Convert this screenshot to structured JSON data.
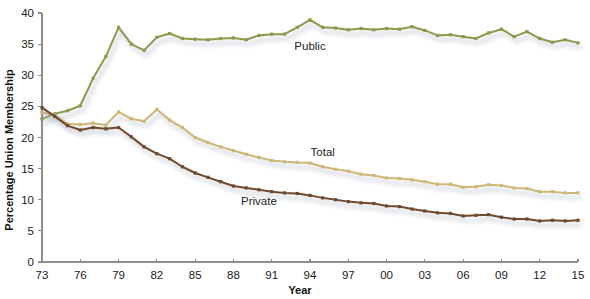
{
  "chart_data": {
    "type": "line",
    "title": "",
    "xlabel": "Year",
    "ylabel": "Percentage Union Membership",
    "xlim": [
      1973,
      2015
    ],
    "ylim": [
      0,
      40
    ],
    "grid": false,
    "legend_position": "inline-labels",
    "y_ticks": [
      "0",
      "5",
      "10",
      "15",
      "20",
      "25",
      "30",
      "35",
      "40"
    ],
    "y_tick_values": [
      0,
      5,
      10,
      15,
      20,
      25,
      30,
      35,
      40
    ],
    "x_ticks": [
      "73",
      "76",
      "79",
      "82",
      "85",
      "88",
      "91",
      "94",
      "97",
      "00",
      "03",
      "06",
      "09",
      "12",
      "15"
    ],
    "x_tick_values": [
      1973,
      1976,
      1979,
      1982,
      1985,
      1988,
      1991,
      1994,
      1997,
      2000,
      2003,
      2006,
      2009,
      2012,
      2015
    ],
    "x": [
      1973,
      1974,
      1975,
      1976,
      1977,
      1978,
      1979,
      1980,
      1981,
      1982,
      1983,
      1984,
      1985,
      1986,
      1987,
      1988,
      1989,
      1990,
      1991,
      1992,
      1993,
      1994,
      1995,
      1996,
      1997,
      1998,
      1999,
      2000,
      2001,
      2002,
      2003,
      2004,
      2005,
      2006,
      2007,
      2008,
      2009,
      2010,
      2011,
      2012,
      2013,
      2014,
      2015
    ],
    "series": [
      {
        "name": "Public",
        "color": "#8c9a4d",
        "label": "Public",
        "label_x": 1994,
        "label_y": 34.0,
        "values": [
          23.0,
          23.8,
          24.3,
          25.1,
          29.5,
          33.0,
          37.7,
          35.0,
          34.0,
          36.1,
          36.7,
          35.9,
          35.8,
          35.7,
          35.9,
          36.0,
          35.7,
          36.4,
          36.6,
          36.6,
          37.7,
          38.9,
          37.7,
          37.6,
          37.3,
          37.5,
          37.3,
          37.5,
          37.4,
          37.8,
          37.2,
          36.4,
          36.5,
          36.2,
          35.9,
          36.8,
          37.4,
          36.2,
          37.0,
          35.9,
          35.3,
          35.7,
          35.2
        ]
      },
      {
        "name": "Total",
        "color": "#cdb877",
        "label": "Total",
        "label_x": 1995,
        "label_y": 17.0,
        "values": [
          24.0,
          23.6,
          22.2,
          22.1,
          22.3,
          22.0,
          24.1,
          23.0,
          22.6,
          24.5,
          22.8,
          21.6,
          20.0,
          19.2,
          18.5,
          17.9,
          17.3,
          16.8,
          16.3,
          16.1,
          16.0,
          15.9,
          15.3,
          14.9,
          14.6,
          14.1,
          13.9,
          13.5,
          13.4,
          13.2,
          12.9,
          12.5,
          12.5,
          12.0,
          12.1,
          12.4,
          12.3,
          11.9,
          11.8,
          11.3,
          11.3,
          11.1,
          11.1
        ]
      },
      {
        "name": "Private",
        "color": "#70492f",
        "label": "Private",
        "label_x": 1990,
        "label_y": 9.2,
        "values": [
          24.8,
          23.4,
          21.9,
          21.2,
          21.6,
          21.4,
          21.6,
          20.1,
          18.5,
          17.4,
          16.6,
          15.3,
          14.3,
          13.6,
          12.9,
          12.2,
          11.9,
          11.6,
          11.3,
          11.1,
          11.0,
          10.7,
          10.3,
          10.0,
          9.7,
          9.5,
          9.4,
          9.0,
          8.9,
          8.5,
          8.2,
          7.9,
          7.8,
          7.4,
          7.5,
          7.6,
          7.2,
          6.9,
          6.9,
          6.6,
          6.7,
          6.6,
          6.7
        ]
      }
    ]
  }
}
